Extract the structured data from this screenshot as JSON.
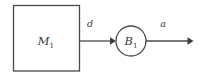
{
  "diagram": {
    "type": "block-diagram",
    "background_color": "#ffffff",
    "stroke_color": "#4a4a4a",
    "text_color": "#3a3a3a",
    "nodes": [
      {
        "id": "m1",
        "shape": "rectangle",
        "label_base": "M",
        "label_sub": "1",
        "x": 13,
        "y": 5,
        "width": 67,
        "height": 66
      },
      {
        "id": "b1",
        "shape": "circle",
        "label_base": "B",
        "label_sub": "1",
        "cx": 131,
        "cy": 41,
        "r": 15
      }
    ],
    "edges": [
      {
        "id": "edge-d",
        "label": "d",
        "from": "m1",
        "to": "b1",
        "x1": 80,
        "x2": 114,
        "y": 41,
        "label_x": 90,
        "label_y": 27
      },
      {
        "id": "edge-a",
        "label": "a",
        "from": "b1",
        "to": "output",
        "x1": 147,
        "x2": 193,
        "y": 41,
        "label_x": 163,
        "label_y": 27
      }
    ]
  }
}
